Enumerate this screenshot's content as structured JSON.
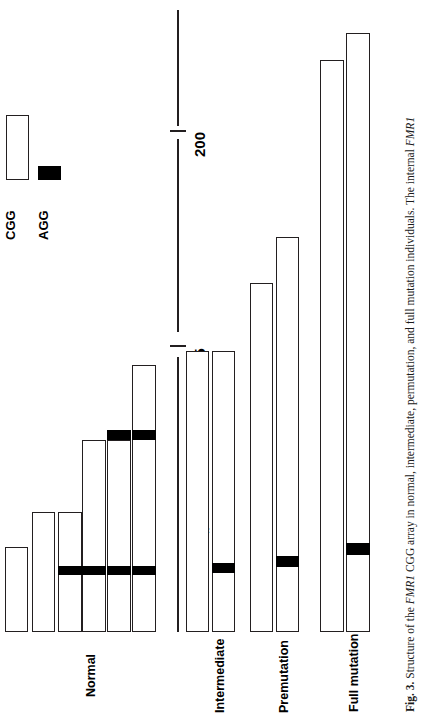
{
  "figure": {
    "axis": {
      "title_text": "(CGG)",
      "title_sub": "n",
      "title_suffix": " number",
      "ticks": [
        {
          "label": "200",
          "value": 200
        },
        {
          "label": "55",
          "value": 55
        }
      ]
    },
    "legend": {
      "items": [
        {
          "label": "CGG",
          "swatch": "white-open-bar",
          "name": "legend-cgg"
        },
        {
          "label": "AGG",
          "swatch": "black-filled-bar",
          "name": "legend-agg"
        }
      ]
    },
    "groups": [
      {
        "label": "Normal",
        "bar_count": 5
      },
      {
        "label": "Intermediate",
        "bar_count": 2
      },
      {
        "label": "Premutation",
        "bar_count": 2
      },
      {
        "label": "Full mutation",
        "bar_count": 2
      }
    ],
    "caption": {
      "figure_number": "Fig. 3.",
      "text_1": " Structure of the ",
      "gene_1": "FMR1",
      "text_2": " CGG array in normal, intermediate, permutation, and full mutation individuals. The internal ",
      "gene_2": "FMR1",
      "full": "Fig. 3. Structure of the FMR1 CGG array in normal, intermediate, permutation, and full mutation individuals. The internal FMR1"
    },
    "colors": {
      "cgg_fill": "#ffffff",
      "cgg_stroke": "#231f20",
      "agg_fill": "#000000",
      "axis": "#231f20",
      "background": "#ffffff"
    }
  },
  "chart_data": {
    "type": "bar",
    "title": "Structure of the FMR1 CGG array",
    "orientation": "vertical-bars-rotated",
    "xlabel": "",
    "ylabel": "(CGG)n number",
    "ylim": [
      0,
      260
    ],
    "grid": false,
    "legend": [
      "CGG",
      "AGG"
    ],
    "axis_ticks": [
      55,
      200
    ],
    "categories": [
      "Normal",
      "Intermediate",
      "Premutation",
      "Full mutation"
    ],
    "bars": [
      {
        "group": "Normal",
        "index": 1,
        "cgg_total": 20,
        "agg_positions": []
      },
      {
        "group": "Normal",
        "index": 2,
        "cgg_total": 29,
        "agg_positions": []
      },
      {
        "group": "Normal",
        "index": 3,
        "cgg_total": 29,
        "agg_positions": [
          9
        ]
      },
      {
        "group": "Normal",
        "index": 4,
        "cgg_total": 47,
        "agg_positions": [
          9
        ]
      },
      {
        "group": "Normal",
        "index": 5,
        "cgg_total": 47,
        "agg_positions": [
          9,
          33
        ]
      },
      {
        "group": "Normal",
        "index": 6,
        "cgg_total": 66,
        "agg_positions": [
          9,
          33
        ]
      },
      {
        "group": "Intermediate",
        "index": 1,
        "cgg_total": 70,
        "agg_positions": []
      },
      {
        "group": "Intermediate",
        "index": 2,
        "cgg_total": 70,
        "agg_positions": [
          13
        ]
      },
      {
        "group": "Premutation",
        "index": 1,
        "cgg_total": 87,
        "agg_positions": []
      },
      {
        "group": "Premutation",
        "index": 2,
        "cgg_total": 99,
        "agg_positions": [
          15
        ]
      },
      {
        "group": "Full mutation",
        "index": 1,
        "cgg_total": 143,
        "agg_positions": []
      },
      {
        "group": "Full mutation",
        "index": 2,
        "cgg_total": 150,
        "agg_positions": [
          19
        ]
      }
    ]
  },
  "geometry": {
    "baseline_y": 632,
    "bars": [
      {
        "name": "bar-normal-1",
        "x": 5,
        "w": 23,
        "top": 547,
        "aggs": []
      },
      {
        "name": "bar-normal-2",
        "x": 32,
        "w": 23,
        "top": 512,
        "aggs": []
      },
      {
        "name": "bar-normal-3",
        "x": 58,
        "w": 24,
        "top": 512,
        "aggs": [
          {
            "y": 566,
            "h": 9
          }
        ]
      },
      {
        "name": "bar-normal-4",
        "x": 82,
        "w": 24,
        "top": 440,
        "aggs": [
          {
            "y": 566,
            "h": 9
          }
        ]
      },
      {
        "name": "bar-normal-5",
        "x": 107,
        "w": 24,
        "top": 440,
        "aggs": [
          {
            "y": 566,
            "h": 9
          },
          {
            "y": 430,
            "h": 10
          }
        ]
      },
      {
        "name": "bar-normal-6",
        "x": 132,
        "w": 24,
        "top": 365,
        "aggs": [
          {
            "y": 566,
            "h": 9
          },
          {
            "y": 430,
            "h": 10
          }
        ]
      },
      {
        "name": "bar-intermediate-1",
        "x": 186,
        "w": 23,
        "top": 351,
        "aggs": []
      },
      {
        "name": "bar-intermediate-2",
        "x": 212,
        "w": 23,
        "top": 351,
        "aggs": [
          {
            "y": 563,
            "h": 10
          }
        ]
      },
      {
        "name": "bar-premutation-1",
        "x": 250,
        "w": 23,
        "top": 283,
        "aggs": []
      },
      {
        "name": "bar-premutation-2",
        "x": 276,
        "w": 23,
        "top": 237,
        "aggs": [
          {
            "y": 556,
            "h": 11
          }
        ]
      },
      {
        "name": "bar-fullmutation-1",
        "x": 320,
        "w": 24,
        "top": 60,
        "aggs": []
      },
      {
        "name": "bar-fullmutation-2",
        "x": 346,
        "w": 24,
        "top": 33,
        "aggs": [
          {
            "y": 543,
            "h": 12
          }
        ]
      }
    ]
  }
}
